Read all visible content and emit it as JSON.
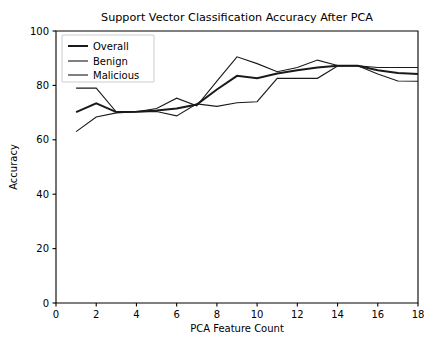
{
  "chart_data": {
    "type": "line",
    "title": "Support Vector Classification Accuracy After PCA",
    "xlabel": "PCA Feature Count",
    "ylabel": "Accuracy",
    "xlim": [
      0,
      18
    ],
    "ylim": [
      0,
      100
    ],
    "xticks": [
      0,
      2,
      4,
      6,
      8,
      10,
      12,
      14,
      16,
      18
    ],
    "yticks": [
      0,
      20,
      40,
      60,
      80,
      100
    ],
    "xtick_labels": [
      "0",
      "2",
      "4",
      "6",
      "8",
      "10",
      "12",
      "14",
      "16",
      "18"
    ],
    "ytick_labels": [
      "0",
      "20",
      "40",
      "60",
      "80",
      "100"
    ],
    "grid": false,
    "legend_position": "upper left",
    "x": [
      1,
      2,
      3,
      4,
      5,
      6,
      7,
      8,
      9,
      10,
      11,
      12,
      13,
      14,
      15,
      16,
      17,
      18
    ],
    "series": [
      {
        "name": "Overall",
        "color": "#1a1a1a",
        "linewidth": 2.0,
        "values": [
          70.2,
          73.4,
          70.2,
          70.3,
          70.8,
          71.5,
          73.0,
          78.5,
          83.5,
          82.6,
          84.4,
          85.6,
          86.6,
          87.2,
          87.2,
          85.6,
          84.6,
          84.2
        ]
      },
      {
        "name": "Benign",
        "color": "#1a1a1a",
        "linewidth": 1.1,
        "values": [
          79.0,
          79.0,
          70.2,
          70.3,
          71.5,
          75.3,
          72.5,
          81.6,
          90.5,
          88.0,
          85.0,
          86.6,
          89.3,
          87.3,
          87.2,
          86.6,
          86.6,
          86.6
        ]
      },
      {
        "name": "Malicious",
        "color": "#1a1a1a",
        "linewidth": 1.1,
        "values": [
          63.0,
          68.4,
          69.9,
          70.3,
          70.4,
          68.8,
          73.2,
          72.3,
          73.6,
          74.0,
          82.6,
          82.6,
          82.6,
          87.1,
          87.2,
          84.2,
          81.6,
          81.5
        ]
      }
    ]
  },
  "legend": {
    "entries": [
      {
        "label": "Overall"
      },
      {
        "label": "Benign"
      },
      {
        "label": "Malicious"
      }
    ]
  }
}
